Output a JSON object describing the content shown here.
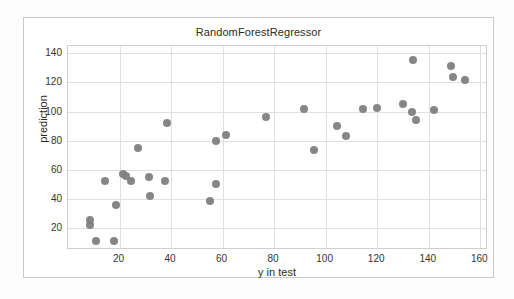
{
  "figure": {
    "title": "RandomForestRegressor",
    "background_color": "#ffffff",
    "frame_color": "#c9c9c9",
    "marker_color": "#7f7f7f",
    "grid_color": "#dfdfdf"
  },
  "chart_data": {
    "type": "scatter",
    "title": "RandomForestRegressor",
    "xlabel": "y in test",
    "ylabel": "prediction",
    "xlim": [
      0,
      163
    ],
    "ylim": [
      5,
      145
    ],
    "xticks": [
      20,
      40,
      60,
      80,
      100,
      120,
      140,
      160
    ],
    "yticks": [
      20,
      40,
      60,
      80,
      100,
      120,
      140
    ],
    "grid": true,
    "legend": null,
    "series": [
      {
        "name": "predictions",
        "color": "#7f7f7f",
        "marker": "circle",
        "points": [
          [
            8.5,
            25.5
          ],
          [
            8.5,
            22.0
          ],
          [
            11.0,
            11.0
          ],
          [
            14.5,
            52.5
          ],
          [
            18.0,
            11.0
          ],
          [
            18.5,
            36.0
          ],
          [
            21.5,
            57.0
          ],
          [
            22.5,
            55.5
          ],
          [
            24.5,
            52.5
          ],
          [
            27.0,
            75.0
          ],
          [
            31.5,
            55.0
          ],
          [
            32.0,
            42.0
          ],
          [
            37.5,
            52.5
          ],
          [
            38.5,
            92.0
          ],
          [
            55.0,
            38.5
          ],
          [
            57.5,
            50.0
          ],
          [
            57.5,
            80.0
          ],
          [
            61.5,
            84.0
          ],
          [
            77.0,
            96.5
          ],
          [
            91.5,
            102.0
          ],
          [
            95.5,
            73.5
          ],
          [
            104.5,
            90.0
          ],
          [
            108.0,
            83.0
          ],
          [
            114.5,
            102.0
          ],
          [
            120.0,
            102.5
          ],
          [
            130.0,
            105.0
          ],
          [
            133.5,
            100.0
          ],
          [
            134.0,
            135.5
          ],
          [
            135.0,
            94.0
          ],
          [
            142.0,
            101.0
          ],
          [
            148.5,
            131.0
          ],
          [
            149.5,
            124.0
          ],
          [
            154.0,
            121.5
          ]
        ]
      }
    ]
  }
}
